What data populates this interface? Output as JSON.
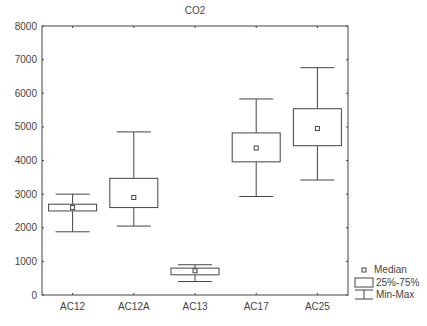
{
  "chart_data": {
    "type": "boxplot",
    "title": "CO2",
    "xlabel": "",
    "ylabel": "",
    "ylim": [
      0,
      8000
    ],
    "yticks": [
      0,
      1000,
      2000,
      3000,
      4000,
      5000,
      6000,
      7000,
      8000
    ],
    "grid": false,
    "legend_position": "bottom-right",
    "legend": [
      "Median",
      "25%-75%",
      "Min-Max"
    ],
    "categories": [
      "AC12",
      "AC12A",
      "AC13",
      "AC17",
      "AC25"
    ],
    "series": [
      {
        "name": "AC12",
        "min": 1880,
        "q1": 2500,
        "median": 2600,
        "q3": 2700,
        "max": 3000
      },
      {
        "name": "AC12A",
        "min": 2050,
        "q1": 2600,
        "median": 2900,
        "q3": 3470,
        "max": 4850
      },
      {
        "name": "AC13",
        "min": 400,
        "q1": 600,
        "median": 720,
        "q3": 800,
        "max": 900
      },
      {
        "name": "AC17",
        "min": 2930,
        "q1": 3960,
        "median": 4370,
        "q3": 4820,
        "max": 5830
      },
      {
        "name": "AC25",
        "min": 3420,
        "q1": 4440,
        "median": 4950,
        "q3": 5540,
        "max": 6760
      }
    ]
  },
  "labels": {
    "title": "CO2",
    "legend_median": "Median",
    "legend_box": "25%-75%",
    "legend_whisker": "Min-Max"
  }
}
